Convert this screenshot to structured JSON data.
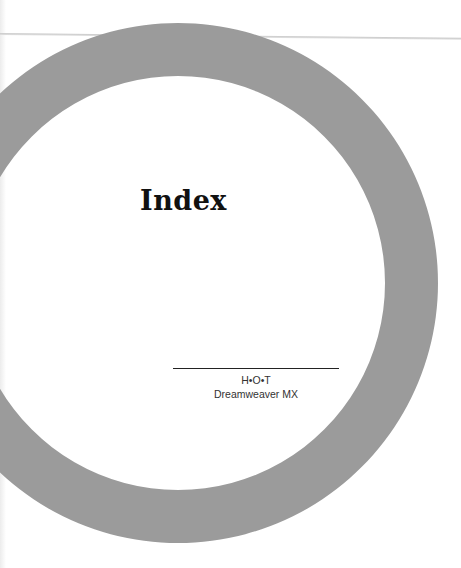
{
  "page": {
    "title": "Index",
    "series_name": "H•O•T",
    "book_title": "Dreamweaver MX"
  },
  "colors": {
    "ring": "#9b9b9b",
    "background": "#ffffff",
    "text": "#111111"
  }
}
